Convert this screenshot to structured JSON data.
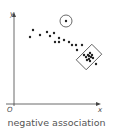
{
  "diagram": {
    "title": "negative association",
    "axis_x_label": "x",
    "axis_y_label": "y",
    "origin_label": "O",
    "colors": {
      "axis": "#444444",
      "dot": "#222222",
      "outline": "#444444",
      "caption": "#555555"
    },
    "points": [
      [
        30,
        37
      ],
      [
        33,
        30
      ],
      [
        40,
        35
      ],
      [
        47,
        32
      ],
      [
        50,
        36
      ],
      [
        54,
        33
      ],
      [
        55,
        42
      ],
      [
        59,
        42
      ],
      [
        59,
        38
      ],
      [
        64,
        40
      ],
      [
        69,
        42
      ],
      [
        72,
        45
      ],
      [
        76,
        45
      ],
      [
        77,
        50
      ],
      [
        82,
        45
      ],
      [
        84,
        55
      ]
    ],
    "outlier": {
      "point": [
        66,
        21
      ],
      "circle_radius": 6
    },
    "cluster": {
      "points": [
        [
          86,
          57
        ],
        [
          88,
          55
        ],
        [
          89,
          59
        ],
        [
          90,
          53
        ],
        [
          91,
          57
        ],
        [
          92,
          55
        ],
        [
          87,
          60
        ],
        [
          90,
          61
        ],
        [
          93,
          58
        ],
        [
          89,
          56
        ],
        [
          96,
          64
        ]
      ],
      "box": {
        "cx": 89,
        "cy": 57,
        "w": 14,
        "h": 22,
        "rotate": 45
      }
    }
  }
}
